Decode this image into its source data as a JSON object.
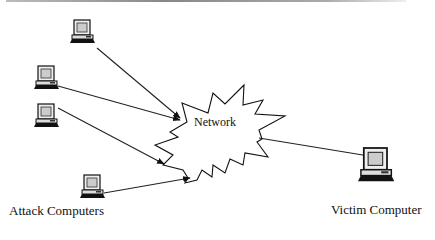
{
  "diagram": {
    "network_label": "Network",
    "attack_label": "Attack Computers",
    "victim_label": "Victim Computer",
    "nodes": [
      {
        "id": "attacker-1",
        "role": "attack computer",
        "icon": "computer-icon"
      },
      {
        "id": "attacker-2",
        "role": "attack computer",
        "icon": "computer-icon"
      },
      {
        "id": "attacker-3",
        "role": "attack computer",
        "icon": "computer-icon"
      },
      {
        "id": "attacker-4",
        "role": "attack computer",
        "icon": "computer-icon"
      },
      {
        "id": "network",
        "role": "network",
        "icon": "starburst-cloud"
      },
      {
        "id": "victim",
        "role": "victim computer",
        "icon": "computer-icon"
      }
    ],
    "edges": [
      {
        "from": "attacker-1",
        "to": "network"
      },
      {
        "from": "attacker-2",
        "to": "network"
      },
      {
        "from": "attacker-3",
        "to": "network"
      },
      {
        "from": "attacker-4",
        "to": "network"
      },
      {
        "from": "network",
        "to": "victim"
      }
    ]
  }
}
